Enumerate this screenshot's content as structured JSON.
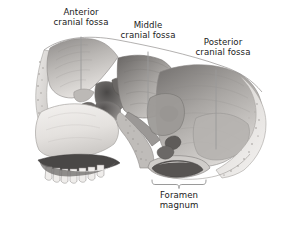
{
  "figure": {
    "kind": "anatomical-illustration",
    "style": "grayscale pencil and wash medical illustration",
    "background_color": "#ffffff",
    "width": 290,
    "height": 234
  },
  "labels": {
    "anterior": {
      "line1": "Anterior",
      "line2": "cranial fossa"
    },
    "middle": {
      "line1": "Middle",
      "line2": "cranial fossa"
    },
    "posterior": {
      "line1": "Posterior",
      "line2": "cranial fossa"
    },
    "foramen": {
      "line1": "Foramen",
      "line2": "magnum"
    }
  },
  "colors": {
    "text": "#1a1a1a",
    "leader_line": "#9a9a9a",
    "bracket": "#8f8f8f",
    "bone_light": "#f2f0ee",
    "bone_mid": "#d8d5d2",
    "bone_shadow": "#9e9b99",
    "bone_dark": "#5d5a58",
    "cavity_dark": "#3e3c3b"
  },
  "leader_lines": [
    {
      "name": "anterior",
      "x1": 81,
      "y1": 37,
      "x2": 81,
      "y2": 89
    },
    {
      "name": "middle",
      "x1": 148,
      "y1": 52,
      "x2": 148,
      "y2": 114
    },
    {
      "name": "posterior",
      "x1": 216,
      "y1": 70,
      "x2": 216,
      "y2": 149
    }
  ],
  "bracket": {
    "name": "foramen-magnum-bracket",
    "left": 152,
    "right": 206,
    "y": 184,
    "tip_y": 189
  }
}
